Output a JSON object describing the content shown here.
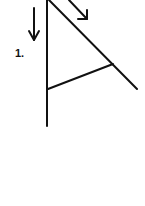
{
  "diagram": {
    "step_label": "1.",
    "stroke_color": "#111111",
    "background": "#ffffff",
    "lines": {
      "vertical": {
        "x1": 47,
        "y1": 0,
        "x2": 47,
        "y2": 126
      },
      "diagonal": {
        "x1": 49,
        "y1": 0,
        "x2": 137,
        "y2": 89
      },
      "crossbar": {
        "x1": 48,
        "y1": 89,
        "x2": 113,
        "y2": 64
      }
    },
    "arrows": [
      {
        "name": "down-arrow",
        "x1": 34,
        "y1": 8,
        "x2": 34,
        "y2": 40
      },
      {
        "name": "diagonal-arrow",
        "x1": 69,
        "y1": 0,
        "x2": 87,
        "y2": 19
      }
    ]
  }
}
